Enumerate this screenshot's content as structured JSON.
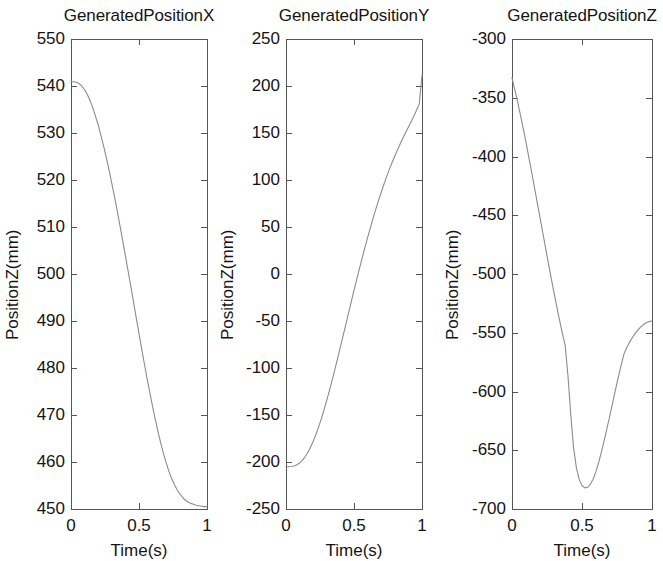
{
  "figure": {
    "background": "#ffffff",
    "line_color": "#8c8c8c",
    "axis_color": "#555555",
    "text_color": "#141414",
    "panel_count": 3
  },
  "chart_data": [
    {
      "type": "line",
      "title": "GeneratedPositionX",
      "xlabel": "Time(s)",
      "ylabel": "PositionZ(mm)",
      "xlim": [
        0,
        1
      ],
      "ylim": [
        450,
        550
      ],
      "grid": false,
      "legend": null,
      "xticks": [
        0,
        0.5,
        1
      ],
      "xtick_labels": [
        "0",
        "0.5",
        "1"
      ],
      "yticks": [
        450,
        460,
        470,
        480,
        490,
        500,
        510,
        520,
        530,
        540,
        550
      ],
      "ytick_labels": [
        "450",
        "460",
        "470",
        "480",
        "490",
        "500",
        "510",
        "520",
        "530",
        "540",
        "550"
      ],
      "series": [
        {
          "name": "GeneratedPositionX",
          "x": [
            0.0,
            0.02,
            0.04,
            0.06,
            0.08,
            0.1,
            0.12,
            0.14,
            0.16,
            0.18,
            0.2,
            0.22,
            0.24,
            0.26,
            0.28,
            0.3,
            0.32,
            0.34,
            0.36,
            0.38,
            0.4,
            0.42,
            0.44,
            0.46,
            0.48,
            0.5,
            0.52,
            0.54,
            0.56,
            0.58,
            0.6,
            0.62,
            0.64,
            0.66,
            0.68,
            0.7,
            0.72,
            0.74,
            0.76,
            0.78,
            0.8,
            0.82,
            0.84,
            0.86,
            0.88,
            0.9,
            0.92,
            0.94,
            0.96,
            0.98,
            1.0
          ],
          "y": [
            540.9,
            540.9,
            540.8,
            540.5,
            540.0,
            539.2,
            538.2,
            536.9,
            535.4,
            533.6,
            531.7,
            529.5,
            527.2,
            524.7,
            522.1,
            519.3,
            516.4,
            513.4,
            510.3,
            507.1,
            503.9,
            500.6,
            497.3,
            494.0,
            490.6,
            487.3,
            484.0,
            480.8,
            477.7,
            474.7,
            471.8,
            469.0,
            466.4,
            464.0,
            461.8,
            459.8,
            458.0,
            456.5,
            455.2,
            454.1,
            453.2,
            452.5,
            451.9,
            451.5,
            451.2,
            451.0,
            450.8,
            450.7,
            450.6,
            450.5,
            450.5
          ]
        }
      ]
    },
    {
      "type": "line",
      "title": "GeneratedPositionY",
      "xlabel": "Time(s)",
      "ylabel": "PositionZ(mm)",
      "xlim": [
        0,
        1
      ],
      "ylim": [
        -250,
        250
      ],
      "grid": false,
      "legend": null,
      "xticks": [
        0,
        0.5,
        1
      ],
      "xtick_labels": [
        "0",
        "0.5",
        "1"
      ],
      "yticks": [
        -250,
        -200,
        -150,
        -100,
        -50,
        0,
        50,
        100,
        150,
        200,
        250
      ],
      "ytick_labels": [
        "-250",
        "-200",
        "-150",
        "-100",
        "-50",
        "0",
        "50",
        "100",
        "150",
        "200",
        "250"
      ],
      "series": [
        {
          "name": "GeneratedPositionY",
          "x": [
            0.0,
            0.02,
            0.04,
            0.06,
            0.08,
            0.1,
            0.12,
            0.14,
            0.16,
            0.18,
            0.2,
            0.22,
            0.24,
            0.26,
            0.28,
            0.3,
            0.32,
            0.34,
            0.36,
            0.38,
            0.4,
            0.42,
            0.44,
            0.46,
            0.48,
            0.5,
            0.52,
            0.54,
            0.56,
            0.58,
            0.6,
            0.62,
            0.64,
            0.66,
            0.68,
            0.7,
            0.72,
            0.74,
            0.76,
            0.78,
            0.8,
            0.82,
            0.84,
            0.86,
            0.88,
            0.9,
            0.92,
            0.94,
            0.96,
            0.98,
            1.0
          ],
          "y": [
            -205.0,
            -205.0,
            -204.8,
            -204.2,
            -203.0,
            -201.0,
            -198.2,
            -194.5,
            -189.9,
            -184.4,
            -178.0,
            -170.7,
            -162.6,
            -153.8,
            -144.3,
            -134.2,
            -123.6,
            -112.6,
            -101.2,
            -89.5,
            -77.6,
            -65.6,
            -53.5,
            -41.4,
            -29.4,
            -17.5,
            -5.8,
            5.7,
            17.0,
            28.0,
            38.7,
            49.1,
            59.1,
            68.8,
            78.1,
            87.0,
            95.5,
            103.6,
            111.3,
            118.6,
            125.6,
            132.2,
            138.5,
            144.6,
            150.5,
            156.3,
            162.1,
            168.0,
            174.2,
            181.0,
            211.5
          ]
        }
      ]
    },
    {
      "type": "line",
      "title": "GeneratedPositionZ",
      "xlabel": "Time(s)",
      "ylabel": "PositionZ(mm)",
      "xlim": [
        0,
        1
      ],
      "ylim": [
        -700,
        -300
      ],
      "grid": false,
      "legend": null,
      "xticks": [
        0,
        0.5,
        1
      ],
      "xtick_labels": [
        "0",
        "0.5",
        "1"
      ],
      "yticks": [
        -700,
        -650,
        -600,
        -550,
        -500,
        -450,
        -400,
        -350,
        -300
      ],
      "ytick_labels": [
        "-700",
        "-650",
        "-600",
        "-550",
        "-500",
        "-450",
        "-400",
        "-350",
        "-300"
      ],
      "series": [
        {
          "name": "GeneratedPositionZ",
          "x": [
            0.0,
            0.02,
            0.04,
            0.06,
            0.08,
            0.1,
            0.12,
            0.14,
            0.16,
            0.18,
            0.2,
            0.22,
            0.24,
            0.26,
            0.28,
            0.3,
            0.32,
            0.34,
            0.36,
            0.38,
            0.4,
            0.42,
            0.44,
            0.46,
            0.48,
            0.5,
            0.52,
            0.54,
            0.56,
            0.58,
            0.6,
            0.62,
            0.64,
            0.66,
            0.68,
            0.7,
            0.72,
            0.74,
            0.76,
            0.78,
            0.8,
            0.82,
            0.84,
            0.86,
            0.88,
            0.9,
            0.92,
            0.94,
            0.96,
            0.98,
            1.0
          ],
          "y": [
            -333.0,
            -343.0,
            -353.5,
            -364.5,
            -376.0,
            -388.0,
            -400.5,
            -413.0,
            -426.0,
            -439.0,
            -452.0,
            -465.0,
            -478.0,
            -491.0,
            -503.5,
            -516.0,
            -528.0,
            -539.5,
            -550.5,
            -561.0,
            -587.0,
            -620.0,
            -648.0,
            -665.0,
            -675.0,
            -680.0,
            -682.0,
            -681.5,
            -679.0,
            -674.5,
            -668.0,
            -660.0,
            -651.0,
            -641.0,
            -630.5,
            -620.0,
            -609.0,
            -598.0,
            -587.5,
            -577.5,
            -568.0,
            -562.5,
            -558.0,
            -554.0,
            -550.5,
            -547.5,
            -545.0,
            -543.0,
            -541.5,
            -540.5,
            -540.0
          ]
        }
      ]
    }
  ]
}
